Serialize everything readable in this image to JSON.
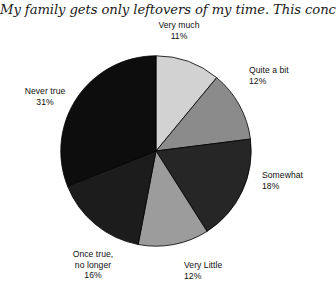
{
  "chart_data": {
    "type": "pie",
    "title": "My family gets only leftovers of my time. This concerns me.",
    "xlabel": "",
    "ylabel": "",
    "legend_position": "none",
    "grid": false,
    "start_angle_deg": 0,
    "direction": "clockwise",
    "categories": [
      "Very much",
      "Quite a bit",
      "Somewhat",
      "Very Little",
      "Once true, no longer",
      "Never true"
    ],
    "values": [
      11,
      12,
      18,
      12,
      16,
      31
    ],
    "value_unit": "%",
    "colors": [
      "#d2d2d2",
      "#8b8b8b",
      "#262626",
      "#9c9c9c",
      "#1c1c1c",
      "#0d0d0d"
    ],
    "slices": [
      {
        "label": "Very much",
        "label_line1": "Very much",
        "percent_text": "11%",
        "value": 11,
        "color": "#d2d2d2"
      },
      {
        "label": "Quite a bit",
        "label_line1": "Quite a bit",
        "percent_text": "12%",
        "value": 12,
        "color": "#8b8b8b"
      },
      {
        "label": "Somewhat",
        "label_line1": "Somewhat",
        "percent_text": "18%",
        "value": 18,
        "color": "#262626"
      },
      {
        "label": "Very Little",
        "label_line1": "Very Little",
        "percent_text": "12%",
        "value": 12,
        "color": "#9c9c9c"
      },
      {
        "label": "Once true, no longer",
        "label_line1": "Once true,",
        "label_line2": "no longer",
        "percent_text": "16%",
        "value": 16,
        "color": "#1c1c1c"
      },
      {
        "label": "Never true",
        "label_line1": "Never true",
        "percent_text": "31%",
        "value": 31,
        "color": "#0d0d0d"
      }
    ]
  }
}
